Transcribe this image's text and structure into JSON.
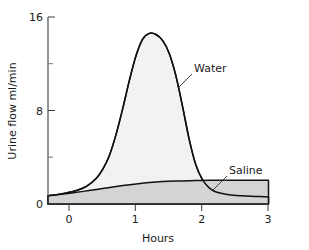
{
  "chart_data": {
    "type": "area",
    "title": "",
    "subtitle": "",
    "xlabel": "Hours",
    "ylabel": "Urine flow ml/min",
    "xlim": [
      -0.33,
      3.0
    ],
    "ylim": [
      0,
      16
    ],
    "xticks": [
      0,
      1,
      2,
      3
    ],
    "xticklabels": [
      "0",
      "1",
      "2",
      "3"
    ],
    "yticks": [
      0,
      4,
      8,
      12,
      16
    ],
    "yticklabels": [
      "0",
      "",
      "8",
      "",
      "16"
    ],
    "ytick_major_labels": [
      "0",
      "8",
      "16"
    ],
    "grid": false,
    "legend": "inline-annotations",
    "annotations": [
      {
        "text": "Water",
        "x": 1.75,
        "y": 10.6,
        "points_to_x": 1.58,
        "points_to_y": 7.0
      },
      {
        "text": "Saline",
        "x": 2.26,
        "y": 4.3,
        "points_to_x": 2.03,
        "points_to_y": 2.0
      }
    ],
    "series": [
      {
        "name": "Water",
        "fill_color": "#f2f2f2",
        "line_color": "#111111",
        "x": [
          -0.33,
          -0.2,
          -0.05,
          0.1,
          0.25,
          0.4,
          0.5,
          0.6,
          0.7,
          0.8,
          0.9,
          1.0,
          1.1,
          1.2,
          1.3,
          1.4,
          1.5,
          1.6,
          1.7,
          1.8,
          1.9,
          2.0,
          2.1,
          2.2,
          2.4,
          2.6,
          2.8,
          3.0
        ],
        "values": [
          0.7,
          0.8,
          0.95,
          1.15,
          1.5,
          2.2,
          3.0,
          4.2,
          6.0,
          8.2,
          10.6,
          12.7,
          14.1,
          14.6,
          14.5,
          14.0,
          12.9,
          11.0,
          8.4,
          5.6,
          3.4,
          2.1,
          1.4,
          1.05,
          0.8,
          0.7,
          0.65,
          0.6
        ]
      },
      {
        "name": "Saline",
        "fill_color": "#d4d4d4",
        "line_color": "#111111",
        "x": [
          -0.33,
          -0.2,
          0.0,
          0.2,
          0.4,
          0.6,
          0.8,
          1.0,
          1.2,
          1.4,
          1.6,
          1.8,
          2.0,
          2.2,
          2.4,
          2.6,
          2.8,
          3.0
        ],
        "values": [
          0.7,
          0.78,
          0.92,
          1.08,
          1.25,
          1.42,
          1.58,
          1.72,
          1.84,
          1.92,
          1.97,
          2.0,
          2.02,
          2.03,
          2.03,
          2.03,
          2.03,
          2.03
        ]
      }
    ]
  },
  "axes": {
    "y_label": "Urine flow ml/min",
    "x_label": "Hours",
    "y_tick_0": "0",
    "y_tick_8": "8",
    "y_tick_16": "16",
    "x_tick_0": "0",
    "x_tick_1": "1",
    "x_tick_2": "2",
    "x_tick_3": "3"
  },
  "labels": {
    "water": "Water",
    "saline": "Saline"
  },
  "colors": {
    "water_fill": "#f2f2f2",
    "saline_fill": "#d4d4d4",
    "line": "#111111",
    "axis": "#3b3b3b",
    "text": "#1a1a1a",
    "background": "#ffffff"
  }
}
